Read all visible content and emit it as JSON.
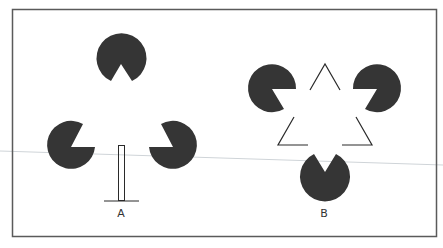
{
  "figure": {
    "panel_a_label": "A",
    "panel_b_label": "B",
    "fill_color": "#353535",
    "stroke_color": "#2a2a2a",
    "border_color": "#5a5a5a"
  }
}
